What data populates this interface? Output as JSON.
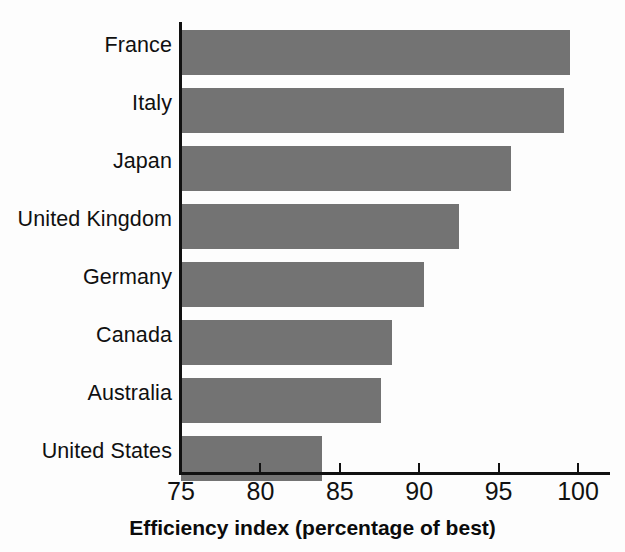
{
  "chart_data": {
    "type": "bar",
    "orientation": "horizontal",
    "title": "",
    "xlabel": "Efficiency index  (percentage of best)",
    "xlabel_main": "Efficiency index",
    "xlabel_note": "(percentage of best)",
    "ylabel": "",
    "categories": [
      "France",
      "Italy",
      "Japan",
      "United Kingdom",
      "Germany",
      "Canada",
      "Australia",
      "United States"
    ],
    "values": [
      99.5,
      99.1,
      95.8,
      92.5,
      90.3,
      88.3,
      87.6,
      83.9
    ],
    "xlim": [
      75,
      102
    ],
    "xticks": [
      75,
      80,
      85,
      90,
      95,
      100
    ],
    "xtick_labels": [
      "75",
      "80",
      "85",
      "90",
      "95",
      "100"
    ],
    "grid": false,
    "legend": false,
    "bar_color": "#737373",
    "axis_color": "#111111",
    "background_color": "#fdfdfd"
  }
}
